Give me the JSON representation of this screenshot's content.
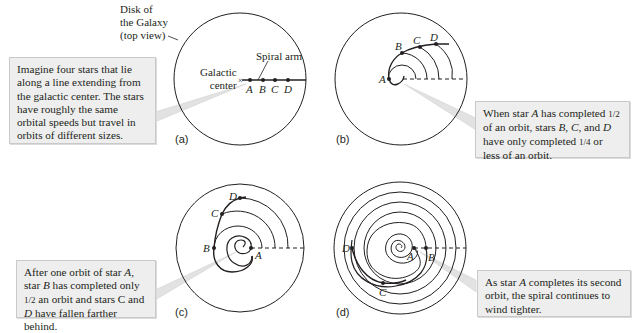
{
  "labels": {
    "disk": [
      "Disk of",
      "the Galaxy",
      "(top view)"
    ],
    "spiral_arm": "Spiral arm",
    "galactic_center": [
      "Galactic",
      "center"
    ]
  },
  "stars": [
    "A",
    "B",
    "C",
    "D"
  ],
  "panels": {
    "a": {
      "tag": "(a)",
      "callout": "Imagine four stars that lie along a line extending from the galactic center. The stars have roughly the same orbital speeds but travel in orbits of different sizes."
    },
    "b": {
      "tag": "(b)",
      "callout_parts": [
        "When star ",
        "A",
        " has completed ",
        "1/2",
        " of an orbit, stars ",
        "B",
        ", ",
        "C",
        ", and ",
        "D",
        " have only completed ",
        "1/4",
        " or less of an orbit."
      ]
    },
    "c": {
      "tag": "(c)",
      "callout_parts": [
        "After one orbit of star ",
        "A",
        ", star ",
        "B",
        " has completed only ",
        "1/2",
        " an orbit and stars C and ",
        "D",
        " have fallen farther behind."
      ]
    },
    "d": {
      "tag": "(d)",
      "callout_parts": [
        "As star ",
        "A",
        " completes its second orbit, the spiral continues to wind tighter."
      ]
    }
  },
  "colors": {
    "ink": "#231f20",
    "callout_bg": "#eeeeee",
    "callout_border": "#c9c9c9",
    "pointer": "#d9d9d9"
  }
}
